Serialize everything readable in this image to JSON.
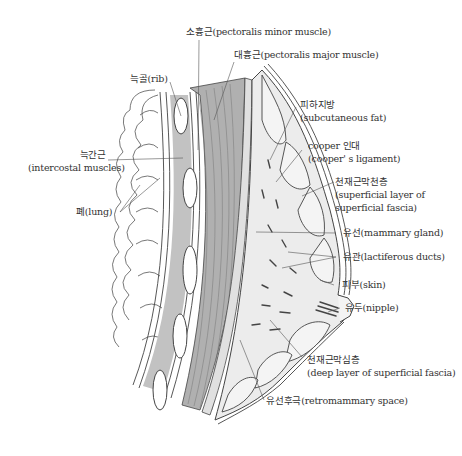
{
  "diagram": {
    "colors": {
      "line": "#444444",
      "muscle_fill": "#b5b5b5",
      "tissue_fill": "#ececec",
      "background": "#ffffff"
    }
  },
  "labels": {
    "pectoralis_minor": "소흉근(pectoralis minor muscle)",
    "pectoralis_major": "대흉근(pectoralis major muscle)",
    "rib": "늑골(rib)",
    "intercostal_ko": "늑간근",
    "intercostal_en": "(intercostal muscles)",
    "lung": "폐(lung)",
    "subcutaneous_ko": "피하지방",
    "subcutaneous_en": "(subcutaneous fat)",
    "cooper_ko": "cooper 인대",
    "cooper_en": "(cooper' s ligament)",
    "superficial_ko": "천재근막천층",
    "superficial_en1": "(superficial layer of",
    "superficial_en2": "superficial fascia)",
    "mammary_gland": "유선(mammary gland)",
    "lactiferous": "유관(lactiferous ducts)",
    "skin": "피부(skin)",
    "nipple": "유두(nipple)",
    "deep_ko": "천재근막심층",
    "deep_en": "(deep layer of superficial fascia)",
    "retromammary": "유선후극(retromammary space)"
  }
}
